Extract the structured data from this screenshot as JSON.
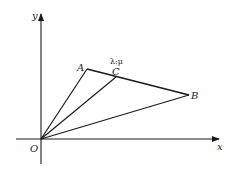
{
  "diagram": {
    "type": "coordinate-geometry",
    "axes": {
      "x_label": "x",
      "y_label": "y",
      "origin_label": "O"
    },
    "points": {
      "O": {
        "label": "O",
        "px": [
          41,
          139
        ]
      },
      "A": {
        "label": "A",
        "px": [
          87,
          69
        ]
      },
      "B": {
        "label": "B",
        "px": [
          189,
          95
        ]
      },
      "C": {
        "label": "C",
        "px": [
          116,
          77
        ]
      }
    },
    "segments": [
      "OA",
      "OB",
      "OC",
      "AB"
    ],
    "annotation": {
      "text": "λ:μ",
      "meaning": "C divides AB in ratio λ:μ"
    },
    "colors": {
      "ink": "#1a1a1a",
      "background": "#ffffff"
    }
  }
}
